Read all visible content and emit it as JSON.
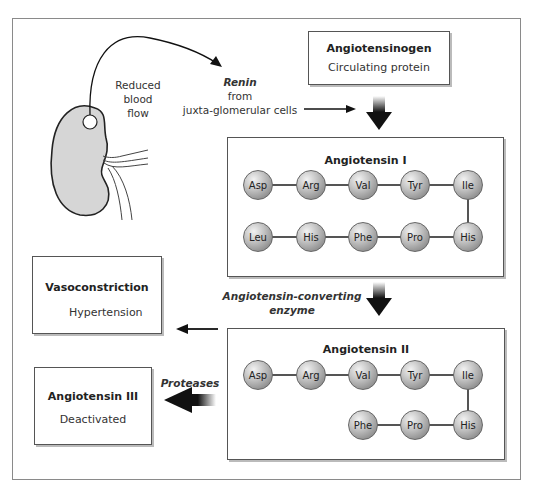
{
  "diagram": {
    "kidney": {
      "label_lines": [
        "Reduced",
        "blood",
        "flow"
      ]
    },
    "renin": {
      "name": "Renin",
      "from": "from",
      "source": "juxta-glomerular cells"
    },
    "angiotensinogen": {
      "title": "Angiotensinogen",
      "subtitle": "Circulating protein"
    },
    "angiotensin_1": {
      "title": "Angiotensin I",
      "row1": [
        "Asp",
        "Arg",
        "Val",
        "Tyr",
        "Ile"
      ],
      "row2": [
        "Leu",
        "His",
        "Phe",
        "Pro",
        "His"
      ]
    },
    "ace": {
      "line1": "Angiotensin-converting",
      "line2": "enzyme"
    },
    "angiotensin_2": {
      "title": "Angiotensin II",
      "row1": [
        "Asp",
        "Arg",
        "Val",
        "Tyr",
        "Ile"
      ],
      "row2": [
        "Phe",
        "Pro",
        "His"
      ]
    },
    "vasoconstriction": {
      "title": "Vasoconstriction",
      "effect": "Hypertension"
    },
    "proteases": {
      "label": "Proteases"
    },
    "angiotensin_3": {
      "title": "Angiotensin III",
      "subtitle": "Deactivated"
    },
    "colors": {
      "residue": "#a8a8a8",
      "arrow": "#111111",
      "border": "#555555"
    }
  }
}
